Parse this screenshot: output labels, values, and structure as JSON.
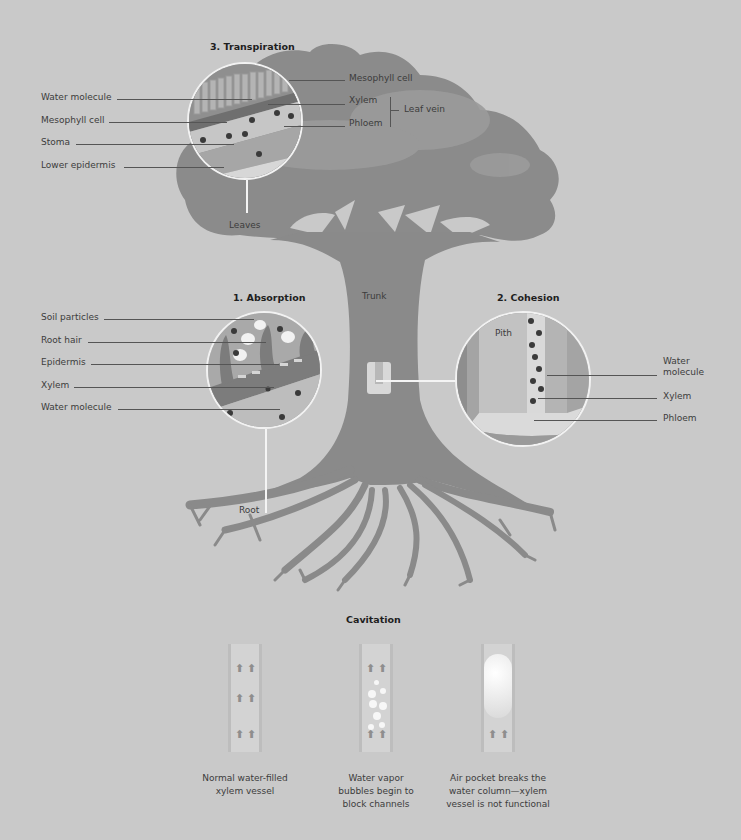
{
  "transpiration": {
    "title": "3. Transpiration",
    "left_labels": [
      "Water molecule",
      "Mesophyll cell",
      "Stoma",
      "Lower epidermis"
    ],
    "right_labels": [
      "Mesophyll cell",
      "Xylem",
      "Phloem"
    ],
    "group_label": "Leaf vein",
    "callout": "Leaves"
  },
  "absorption": {
    "title": "1. Absorption",
    "labels": [
      "Soil particles",
      "Root hair",
      "Epidermis",
      "Xylem",
      "Water molecule"
    ],
    "callout": "Root"
  },
  "trunk_label": "Trunk",
  "cohesion": {
    "title": "2. Cohesion",
    "inner_label": "Pith",
    "labels": [
      "Water molecule",
      "Xylem",
      "Phloem"
    ]
  },
  "cavitation": {
    "title": "Cavitation",
    "panels": [
      {
        "caption_lines": [
          "Normal water-filled",
          "xylem vessel"
        ]
      },
      {
        "caption_lines": [
          "Water vapor",
          "bubbles begin to",
          "block channels"
        ]
      },
      {
        "caption_lines": [
          "Air pocket breaks the",
          "water column—xylem",
          "vessel is not functional"
        ]
      }
    ]
  },
  "icons": {
    "arrow_up": "⬆"
  },
  "colors": {
    "background": "#c9c9c9",
    "tree": "#8a8a8a",
    "canopy_light": "#9a9a9a",
    "circle_border": "#f2f2f2"
  }
}
